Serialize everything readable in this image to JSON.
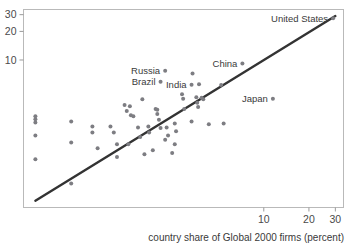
{
  "chart_data": {
    "type": "scatter",
    "title": "",
    "xlabel": "country share of Global 2000 firms (percent)",
    "ylabel": "",
    "xscale": "log",
    "yscale": "log",
    "grid": false,
    "legend": "none",
    "xticks": [
      "10",
      "20",
      "30"
    ],
    "yticks": [
      "10",
      "20",
      "30"
    ],
    "xlim": [
      0.25,
      34
    ],
    "ylim": [
      0.28,
      34
    ],
    "trendline": {
      "x0": 0.3,
      "y0": 0.33,
      "x1": 30.0,
      "y1": 29.0
    },
    "labeled_points": [
      {
        "label": "United States",
        "x": 29.0,
        "y": 27.5,
        "label_side": "left"
      },
      {
        "label": "China",
        "x": 7.2,
        "y": 9.2,
        "label_side": "left"
      },
      {
        "label": "Russia",
        "x": 2.2,
        "y": 7.7,
        "label_side": "left"
      },
      {
        "label": "Brazil",
        "x": 2.05,
        "y": 5.9,
        "label_side": "left"
      },
      {
        "label": "India",
        "x": 3.3,
        "y": 5.5,
        "label_side": "left"
      },
      {
        "label": "Japan",
        "x": 11.5,
        "y": 3.9,
        "label_side": "left"
      }
    ],
    "points": [
      {
        "x": 0.3,
        "y": 2.55
      },
      {
        "x": 0.3,
        "y": 2.38
      },
      {
        "x": 0.3,
        "y": 2.2
      },
      {
        "x": 0.3,
        "y": 1.6
      },
      {
        "x": 0.3,
        "y": 0.9
      },
      {
        "x": 0.52,
        "y": 2.25
      },
      {
        "x": 0.52,
        "y": 1.35
      },
      {
        "x": 0.52,
        "y": 0.5
      },
      {
        "x": 0.72,
        "y": 2.0
      },
      {
        "x": 0.72,
        "y": 1.72
      },
      {
        "x": 0.95,
        "y": 2.0
      },
      {
        "x": 1.0,
        "y": 1.72
      },
      {
        "x": 1.05,
        "y": 1.3
      },
      {
        "x": 1.25,
        "y": 1.3
      },
      {
        "x": 1.18,
        "y": 3.35
      },
      {
        "x": 1.22,
        "y": 2.9
      },
      {
        "x": 1.28,
        "y": 3.25
      },
      {
        "x": 1.35,
        "y": 2.55
      },
      {
        "x": 1.55,
        "y": 3.85
      },
      {
        "x": 1.3,
        "y": 2.62
      },
      {
        "x": 1.45,
        "y": 1.95
      },
      {
        "x": 1.5,
        "y": 1.55
      },
      {
        "x": 1.7,
        "y": 2.0
      },
      {
        "x": 1.72,
        "y": 1.72
      },
      {
        "x": 1.9,
        "y": 3.05
      },
      {
        "x": 1.95,
        "y": 3.0
      },
      {
        "x": 1.95,
        "y": 2.7
      },
      {
        "x": 2.0,
        "y": 2.35
      },
      {
        "x": 2.05,
        "y": 1.92
      },
      {
        "x": 2.25,
        "y": 1.95
      },
      {
        "x": 2.3,
        "y": 1.6
      },
      {
        "x": 2.55,
        "y": 2.15
      },
      {
        "x": 2.6,
        "y": 1.78
      },
      {
        "x": 2.85,
        "y": 4.35
      },
      {
        "x": 2.9,
        "y": 3.9
      },
      {
        "x": 2.95,
        "y": 3.05
      },
      {
        "x": 3.3,
        "y": 2.25
      },
      {
        "x": 3.35,
        "y": 7.2
      },
      {
        "x": 3.55,
        "y": 4.05
      },
      {
        "x": 3.6,
        "y": 3.55
      },
      {
        "x": 3.65,
        "y": 3.2
      },
      {
        "x": 3.7,
        "y": 5.55
      },
      {
        "x": 3.85,
        "y": 4.0
      },
      {
        "x": 3.95,
        "y": 3.85
      },
      {
        "x": 5.2,
        "y": 5.45
      },
      {
        "x": 5.4,
        "y": 2.15
      },
      {
        "x": 4.3,
        "y": 2.1
      },
      {
        "x": 1.05,
        "y": 0.95
      },
      {
        "x": 1.6,
        "y": 1.02
      },
      {
        "x": 2.2,
        "y": 1.45
      },
      {
        "x": 0.78,
        "y": 1.18
      },
      {
        "x": 2.45,
        "y": 1.05
      },
      {
        "x": 2.55,
        "y": 1.3
      },
      {
        "x": 1.82,
        "y": 1.12
      }
    ]
  },
  "axis": {
    "x_title": "country share of Global 2000 firms (percent)"
  }
}
